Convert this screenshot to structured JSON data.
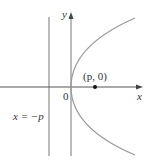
{
  "diagram": {
    "labels": {
      "y_axis": "y",
      "x_axis": "x",
      "origin": "0",
      "focus": "(p, 0)",
      "directrix": "x = −p"
    },
    "elements": {
      "directrix_line": "vertical line x = -p",
      "focus_point": "(p, 0)",
      "curve": "parabola y^2 = 4px opening right, vertex at origin"
    },
    "colors": {
      "axes": "#555555",
      "curve": "#999999",
      "text": "#333333",
      "point": "#111111"
    }
  }
}
